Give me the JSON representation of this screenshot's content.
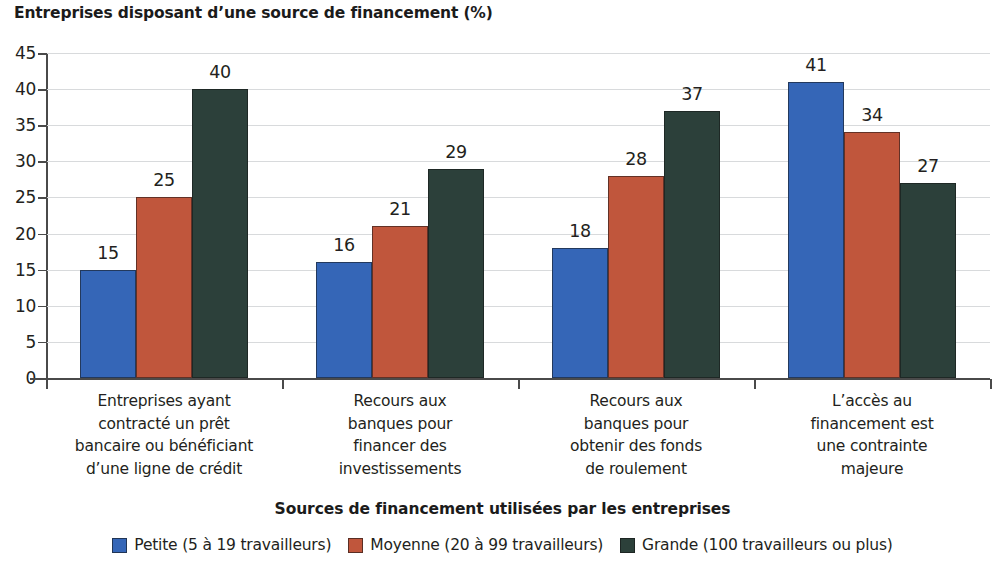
{
  "chart_data": {
    "type": "bar",
    "title": "Entreprises disposant d’une source de financement (%)",
    "xlabel": "Sources de financement utilisées par les entreprises",
    "ylabel": "",
    "ylim": [
      0,
      45
    ],
    "ytick_step": 5,
    "yticks": [
      "45",
      "40",
      "35",
      "30",
      "25",
      "20",
      "15",
      "10",
      "5",
      "0"
    ],
    "grid": true,
    "legend_position": "bottom",
    "categories": [
      "Entreprises ayant contracté un prêt bancaire ou bénéficiant d’une ligne de crédit",
      "Recours aux banques pour financer des investissements",
      "Recours aux banques pour obtenir des fonds de roulement",
      "L’accès au financement est une contrainte majeure"
    ],
    "category_lines": [
      [
        "Entreprises ayant",
        "contracté un prêt",
        "bancaire ou bénéficiant",
        "d’une ligne de crédit"
      ],
      [
        "Recours aux",
        "banques pour",
        "financer des",
        "investissements"
      ],
      [
        "Recours aux",
        "banques pour",
        "obtenir des fonds",
        "de roulement"
      ],
      [
        "L’accès au",
        "financement est",
        "une contrainte",
        "majeure"
      ]
    ],
    "series": [
      {
        "name": "Petite (5 à 19 travailleurs)",
        "color": "#3566b7",
        "values": [
          15,
          16,
          18,
          41
        ]
      },
      {
        "name": "Moyenne (20 à 99 travailleurs)",
        "color": "#c0563c",
        "values": [
          25,
          21,
          28,
          34
        ]
      },
      {
        "name": "Grande (100 travailleurs ou plus)",
        "color": "#2c403a",
        "values": [
          40,
          29,
          37,
          27
        ]
      }
    ],
    "value_labels": [
      [
        "15",
        "25",
        "40"
      ],
      [
        "16",
        "21",
        "29"
      ],
      [
        "18",
        "28",
        "37"
      ],
      [
        "41",
        "34",
        "27"
      ]
    ]
  },
  "legend": {
    "items": [
      {
        "label": "Petite (5 à 19 travailleurs)",
        "color": "#3566b7"
      },
      {
        "label": "Moyenne (20 à 99 travailleurs)",
        "color": "#c0563c"
      },
      {
        "label": "Grande (100 travailleurs ou plus)",
        "color": "#2c403a"
      }
    ]
  }
}
